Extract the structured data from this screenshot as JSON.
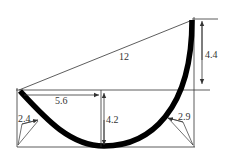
{
  "diagram": {
    "type": "dimensioned-curve-drawing",
    "colors": {
      "line": "#333333",
      "curve": "#000000",
      "background": "#ffffff"
    },
    "labels": {
      "chord": "12",
      "right_height": "4.4",
      "half_span": "5.6",
      "sag_depth": "4.2",
      "left_offset": "2.4",
      "right_offset": "2.9"
    }
  }
}
